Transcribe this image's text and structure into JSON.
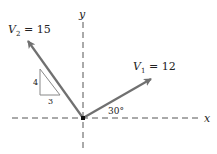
{
  "diagram": {
    "axes": {
      "x_label": "x",
      "y_label": "y"
    },
    "vectors": [
      {
        "name": "V1",
        "label_main": "V",
        "label_sub": "1",
        "label_value": " = 12",
        "magnitude": 12,
        "angle_note": "30°"
      },
      {
        "name": "V2",
        "label_main": "V",
        "label_sub": "2",
        "label_value": " = 15",
        "magnitude": 15,
        "slope_triangle": {
          "rise": "4",
          "run": "3"
        }
      }
    ],
    "colors": {
      "vector": "#707070",
      "axis": "#555555",
      "triangle": "#888888"
    }
  }
}
